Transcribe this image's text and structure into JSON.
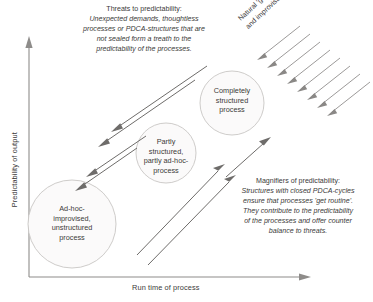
{
  "figure": {
    "axes": {
      "y_title": "Predictability of output",
      "x_title": "Run time of process"
    },
    "nodes": [
      {
        "id": "completely-structured-process",
        "lines": [
          "Completely",
          "structured",
          "process"
        ]
      },
      {
        "id": "partly-structured-process",
        "lines": [
          "Partly",
          "structured,",
          "partly ad-hoc-",
          "process"
        ]
      },
      {
        "id": "ad-hoc-process",
        "lines": [
          "Ad-hoc-",
          "improvised,",
          "unstructured",
          "process"
        ]
      }
    ],
    "annotations": {
      "threats": {
        "lead": "Threats to predictability:",
        "lines": [
          "Unexpected demands, thoughtless",
          "processes or PDCA-structures that are",
          "not sealed form a treath to the",
          "predictability of the processes."
        ]
      },
      "gravity": {
        "lines": [
          "Natural 'gravity' of ad-hoc",
          "and improvisation"
        ]
      },
      "magnifiers": {
        "lead": "Magnifiers of predictability:",
        "lines": [
          "Structures with closed PDCA-cycles",
          "ensure that processes 'get routine'.",
          "They contribute to the predictability",
          "of the processes and offer counter",
          "balance to threats."
        ]
      }
    },
    "colors": {
      "axis": "#8e8c8a",
      "circle_fill": "#fbfafa",
      "circle_stroke": "#c8c6c4",
      "arrow": "#6e6c6a",
      "gravity_arrow": "#8a8886",
      "text": "#3b3a39",
      "background": "#ffffff"
    }
  }
}
